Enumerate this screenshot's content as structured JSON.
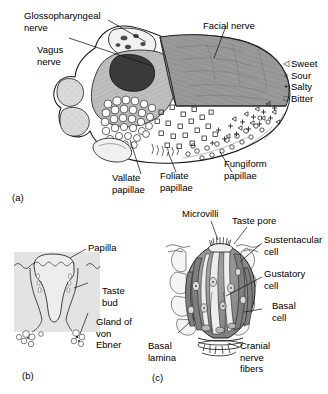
{
  "figure": {
    "panels": [
      {
        "id": "(a)",
        "name": "tongue-dorsum-innervation",
        "labels": [
          {
            "key": "glossopharyngeal",
            "text": "Glossopharyngeal\nnerve"
          },
          {
            "key": "vagus",
            "text": "Vagus\nnerve"
          },
          {
            "key": "facial",
            "text": "Facial nerve"
          },
          {
            "key": "vallate",
            "text": "Vallate\npapillae"
          },
          {
            "key": "foliate",
            "text": "Foliate\npapillae"
          },
          {
            "key": "fungiform",
            "text": "Fungiform\npapillae"
          }
        ],
        "legend": {
          "name": "taste-modality-legend",
          "items": [
            {
              "symbol": "◁",
              "label": "Sweet",
              "glyph": "triangle-left"
            },
            {
              "symbol": "○",
              "label": "Sour",
              "glyph": "circle"
            },
            {
              "symbol": "+",
              "label": "Salty",
              "glyph": "plus"
            },
            {
              "symbol": "□",
              "label": "Bitter",
              "glyph": "square"
            }
          ]
        },
        "regions": [
          {
            "name": "facial-nerve-territory",
            "fill": "#9a9a9a"
          },
          {
            "name": "glossopharyngeal-territory",
            "fill": "#bdbdbd"
          },
          {
            "name": "vagus-territory",
            "fill": "#3a3a3a"
          },
          {
            "name": "lingual-tonsil",
            "fill": "#d8d8d8"
          },
          {
            "name": "anterior-tongue",
            "fill": "#ffffff"
          }
        ]
      },
      {
        "id": "(b)",
        "name": "vallate-papilla-section",
        "labels": [
          {
            "key": "papilla",
            "text": "Papilla"
          },
          {
            "key": "taste_bud",
            "text": "Taste\nbud"
          },
          {
            "key": "gland",
            "text": "Gland of\nvon\nEbner"
          }
        ],
        "background_fill": "#e3e3e3"
      },
      {
        "id": "(c)",
        "name": "taste-bud-structure",
        "labels": [
          {
            "key": "microvilli",
            "text": "Microvilli"
          },
          {
            "key": "taste_pore",
            "text": "Taste pore"
          },
          {
            "key": "sustentacular",
            "text": "Sustentacular\ncell"
          },
          {
            "key": "gustatory",
            "text": "Gustatory\ncell"
          },
          {
            "key": "basal_cell",
            "text": "Basal\ncell"
          },
          {
            "key": "basal_lamina",
            "text": "Basal\nlamina"
          },
          {
            "key": "cranial",
            "text": "Cranial\nnerve\nfibers"
          }
        ],
        "cells": [
          {
            "name": "sustentacular-cell",
            "fill": "#8d8d8d"
          },
          {
            "name": "gustatory-cell",
            "fill": "#eaeaea"
          },
          {
            "name": "basal-cell",
            "fill": "#b5b5b5"
          }
        ]
      }
    ]
  }
}
